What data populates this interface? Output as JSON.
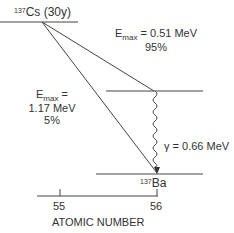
{
  "diagram": {
    "type": "nuclear decay scheme",
    "parent": {
      "mass": "137",
      "symbol": "Cs",
      "halflife": "(30y)"
    },
    "daughter": {
      "mass": "137",
      "symbol": "Ba"
    },
    "beta1": {
      "emax_label": "E",
      "emax_sub": "max",
      "eq": " = 0.51 MeV",
      "percent": "95%"
    },
    "beta2": {
      "emax_label": "E",
      "emax_sub": "max",
      "eq": " =",
      "energy": "1.17 MeV",
      "percent": "5%"
    },
    "gamma": {
      "label": "γ = 0.66 MeV"
    },
    "axis": {
      "title": "ATOMIC NUMBER",
      "ticks": [
        "55",
        "56"
      ]
    }
  },
  "colors": {
    "line": "#444444",
    "text": "#333333"
  }
}
